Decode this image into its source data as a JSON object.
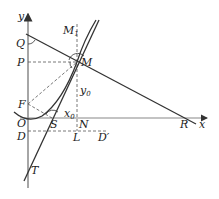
{
  "diagram": {
    "type": "geometry",
    "axes": {
      "x_label": "x",
      "y_label": "y",
      "origin_label": "O"
    },
    "points": {
      "Q": "Q",
      "P": "P",
      "M1": "M",
      "M1_sub": "1",
      "M": "M",
      "y0": "y",
      "y0_sub": "0",
      "F": "F",
      "O": "O",
      "x0": "x",
      "x0_sub": "0",
      "N": "N",
      "R": "R",
      "D": "D",
      "L": "L",
      "Dp": "D′",
      "S": "S",
      "T": "T"
    },
    "colors": {
      "line": "#333333",
      "dashed": "#555555",
      "axis": "#888888"
    }
  }
}
